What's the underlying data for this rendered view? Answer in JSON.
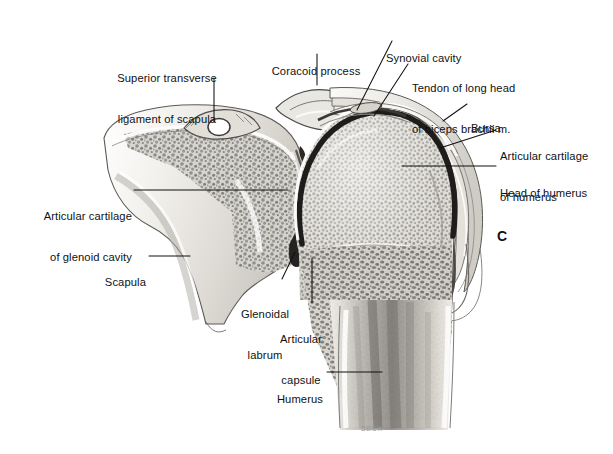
{
  "figure": {
    "panel_letter": "C",
    "signature": "BECK",
    "background_color": "#ffffff",
    "width": 613,
    "height": 454
  },
  "labels": [
    {
      "id": "superior-transverse-ligament",
      "text": "Superior transverse\nligament of scapula",
      "lines": [
        "Superior transverse",
        "ligament of scapula"
      ],
      "align": "center",
      "x": 167,
      "y": 45,
      "leader": {
        "x1": 214,
        "y1": 78,
        "x2": 214,
        "y2": 122
      }
    },
    {
      "id": "coracoid-process",
      "text": "Coracoid process",
      "lines": [
        "Coracoid process"
      ],
      "align": "center",
      "x": 276,
      "y": 38,
      "leader": {
        "x1": 317,
        "y1": 54,
        "x2": 317,
        "y2": 85
      }
    },
    {
      "id": "synovial-cavity",
      "text": "Synovial cavity",
      "lines": [
        "Synovial cavity"
      ],
      "align": "left",
      "x": 386,
      "y": 25,
      "leader": {
        "x1": 392,
        "y1": 41,
        "x2": 357,
        "y2": 110
      }
    },
    {
      "id": "tendon-of-long-head-of-biceps",
      "text": "Tendon of long head\nof biceps brachii m.",
      "lines": [
        "Tendon of long head",
        "of biceps brachii m."
      ],
      "align": "left",
      "x": 412,
      "y": 55,
      "leader": {
        "x1": 408,
        "y1": 64,
        "x2": 374,
        "y2": 116
      }
    },
    {
      "id": "bursa",
      "text": "Bursa",
      "lines": [
        "Bursa"
      ],
      "align": "left",
      "x": 471,
      "y": 95,
      "leader": {
        "x1": 467,
        "y1": 104,
        "x2": 443,
        "y2": 121
      }
    },
    {
      "id": "articular-cartilage-of-humerus",
      "text": "Articular cartilage\nof humerus",
      "lines": [
        "Articular cartilage",
        "of humerus"
      ],
      "align": "left",
      "x": 500,
      "y": 123,
      "leader": {
        "x1": 496,
        "y1": 130,
        "x2": 440,
        "y2": 148
      }
    },
    {
      "id": "head-of-humerus",
      "text": "Head of humerus",
      "lines": [
        "Head of humerus"
      ],
      "align": "left",
      "x": 500,
      "y": 160,
      "leader": {
        "x1": 496,
        "y1": 166,
        "x2": 402,
        "y2": 166
      }
    },
    {
      "id": "articular-cartilage-of-glenoid-cavity",
      "text": "Articular cartilage\nof glenoid cavity",
      "lines": [
        "Articular cartilage",
        "of glenoid cavity"
      ],
      "align": "right",
      "x": 30,
      "y": 183,
      "leader": {
        "x1": 134,
        "y1": 190,
        "x2": 288,
        "y2": 190
      }
    },
    {
      "id": "scapula",
      "text": "Scapula",
      "lines": [
        "Scapula"
      ],
      "align": "right",
      "x": 108,
      "y": 249,
      "leader": {
        "x1": 149,
        "y1": 256,
        "x2": 190,
        "y2": 256
      }
    },
    {
      "id": "glenoidal-labrum",
      "text": "Glenoidal\nlabrum",
      "lines": [
        "Glenoidal",
        "labrum"
      ],
      "align": "center",
      "x": 246,
      "y": 281,
      "leader": {
        "x1": 282,
        "y1": 279,
        "x2": 295,
        "y2": 252
      }
    },
    {
      "id": "articular-capsule",
      "text": "Articular\ncapsule",
      "lines": [
        "Articular",
        "capsule"
      ],
      "align": "center",
      "x": 281,
      "y": 306,
      "leader": {
        "x1": 312,
        "y1": 303,
        "x2": 312,
        "y2": 258
      }
    },
    {
      "id": "humerus",
      "text": "Humerus",
      "lines": [
        "Humerus"
      ],
      "align": "right",
      "x": 281,
      "y": 366,
      "leader": {
        "x1": 327,
        "y1": 372,
        "x2": 382,
        "y2": 372
      }
    }
  ]
}
